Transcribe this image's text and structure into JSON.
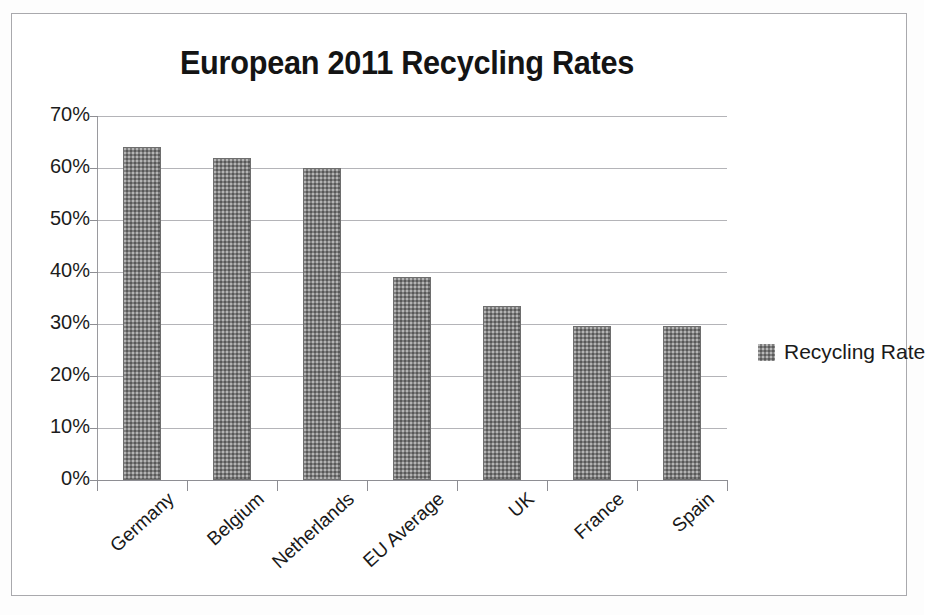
{
  "chart_data": {
    "type": "bar",
    "title": "European 2011 Recycling Rates",
    "xlabel": "",
    "ylabel": "",
    "categories": [
      "Germany",
      "Belgium",
      "Netherlands",
      "EU Average",
      "UK",
      "France",
      "Spain"
    ],
    "values": [
      64,
      62,
      60,
      39,
      33.5,
      29.7,
      29.7
    ],
    "series": [
      {
        "name": "Recycling Rate",
        "values": [
          64,
          62,
          60,
          39,
          33.5,
          29.7,
          29.7
        ]
      }
    ],
    "ylim": [
      0,
      70
    ],
    "ytick_labels": [
      "0%",
      "10%",
      "20%",
      "30%",
      "40%",
      "50%",
      "60%",
      "70%"
    ],
    "ytick_values": [
      0,
      10,
      20,
      30,
      40,
      50,
      60,
      70
    ],
    "grid": true,
    "legend": {
      "position": "right",
      "entries": [
        "Recycling Rate"
      ]
    },
    "bar_color": "#7e7e7e",
    "gridline_color": "#b4b4b8",
    "axis_color": "#8e8e93",
    "text_color": "#1a1a1a",
    "background_color": "#ffffff"
  }
}
